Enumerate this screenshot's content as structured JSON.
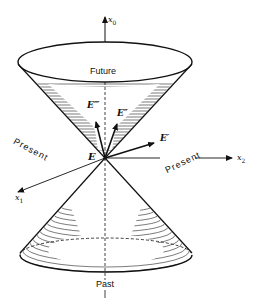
{
  "diagram": {
    "type": "light-cone",
    "labels": {
      "future": "Future",
      "past": "Past",
      "present_left": "Present",
      "present_right": "Present",
      "event": "E",
      "vector_e1": "E′",
      "vector_e2": "E″",
      "vector_e3": "E‴"
    },
    "axes": {
      "x0": {
        "name": "x",
        "sub": "0"
      },
      "x1": {
        "name": "x",
        "sub": "1"
      },
      "x2": {
        "name": "x",
        "sub": "2"
      }
    },
    "colors": {
      "ink": "#111111",
      "background": "#ffffff"
    }
  }
}
